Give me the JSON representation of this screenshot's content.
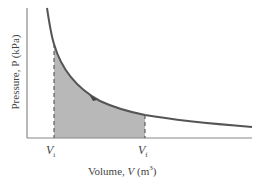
{
  "diagram": {
    "type": "pv-diagram",
    "y_axis_label": "Pressure, P (kPa)",
    "x_axis_label_prefix": "Volume, ",
    "x_axis_var": "V",
    "x_axis_unit_open": " (m",
    "x_axis_unit_exp": "3",
    "x_axis_unit_close": ")",
    "markers": [
      {
        "var": "V",
        "sub": "i"
      },
      {
        "var": "V",
        "sub": "f"
      }
    ],
    "colors": {
      "curve": "#555555",
      "shade": "#b8b8b8",
      "axis": "#888888"
    }
  }
}
